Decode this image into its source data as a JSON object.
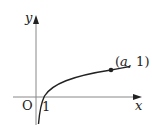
{
  "diagram": {
    "type": "function-graph",
    "function": "logarithmic curve through (1, 0) and (a, 1)",
    "axes": {
      "x_label": "x",
      "y_label": "y",
      "origin_label": "O",
      "x_tick_label": "1"
    },
    "point": {
      "label_open": "(",
      "label_var": "a",
      "label_rest": ", 1)"
    },
    "colors": {
      "axis": "#888888",
      "curve": "#222222",
      "text": "#222222"
    }
  }
}
